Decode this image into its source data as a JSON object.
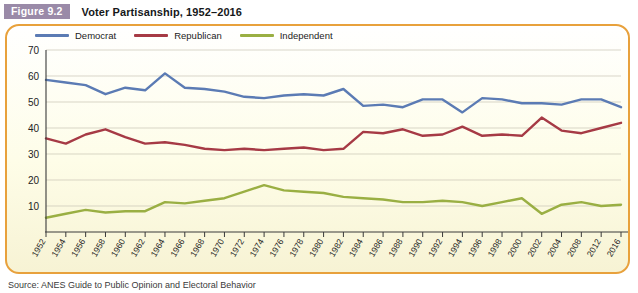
{
  "header": {
    "figure_badge": "Figure 9.2",
    "title": "Voter Partisanship, 1952–2016"
  },
  "legend": {
    "position": "top-left",
    "items": [
      {
        "label": "Democrat",
        "color": "#5b7bb4"
      },
      {
        "label": "Republican",
        "color": "#a63a45"
      },
      {
        "label": "Independent",
        "color": "#9aaf43"
      }
    ]
  },
  "footnote": {
    "source_label": "Source:",
    "source_text": "ANES Guide to Public Opinion and Electoral Behavior"
  },
  "colors": {
    "democrat": "#5b7bb4",
    "republican": "#a63a45",
    "independent": "#9aaf43",
    "panel_border": "#e8a13c",
    "badge": "#9a8aa8",
    "grid": "#c9c4b4",
    "axis": "#3a3a3a"
  },
  "chart_data": {
    "type": "line",
    "title": "Voter Partisanship, 1952–2016",
    "xlabel": "",
    "ylabel": "",
    "ylim": [
      0,
      70
    ],
    "yticks": [
      10,
      20,
      30,
      40,
      50,
      60,
      70
    ],
    "grid": true,
    "legend_position": "top-left",
    "categories": [
      "1952",
      "1954",
      "1956",
      "1958",
      "1960",
      "1962",
      "1964",
      "1966",
      "1968",
      "1970",
      "1972",
      "1974",
      "1976",
      "1978",
      "1980",
      "1982",
      "1984",
      "1986",
      "1988",
      "1990",
      "1992",
      "1994",
      "1996",
      "1998",
      "2000",
      "2002",
      "2004",
      "2008",
      "2012",
      "2016"
    ],
    "series": [
      {
        "name": "Democrat",
        "color": "#5b7bb4",
        "values": [
          58.5,
          57.5,
          56.5,
          53.0,
          55.5,
          54.5,
          61.0,
          55.5,
          55.0,
          54.0,
          52.0,
          51.5,
          52.5,
          53.0,
          52.5,
          55.0,
          48.5,
          49.0,
          48.0,
          51.0,
          51.0,
          46.0,
          51.5,
          51.0,
          49.5,
          49.5,
          49.0,
          51.0,
          51.0,
          48.0
        ]
      },
      {
        "name": "Republican",
        "color": "#a63a45",
        "values": [
          36.0,
          34.0,
          37.5,
          39.5,
          36.5,
          34.0,
          34.5,
          33.5,
          32.0,
          31.5,
          32.0,
          31.5,
          32.0,
          32.5,
          31.5,
          32.0,
          38.5,
          38.0,
          39.5,
          37.0,
          37.5,
          40.5,
          37.0,
          37.5,
          37.0,
          44.0,
          39.0,
          38.0,
          40.0,
          42.0
        ]
      },
      {
        "name": "Independent",
        "color": "#9aaf43",
        "values": [
          5.5,
          7.0,
          8.5,
          7.5,
          8.0,
          8.0,
          11.5,
          11.0,
          12.0,
          13.0,
          15.5,
          18.0,
          16.0,
          15.5,
          15.0,
          13.5,
          13.0,
          12.5,
          11.5,
          11.5,
          12.0,
          11.5,
          10.0,
          11.5,
          13.0,
          7.0,
          10.5,
          11.5,
          10.0,
          10.5
        ]
      }
    ]
  }
}
